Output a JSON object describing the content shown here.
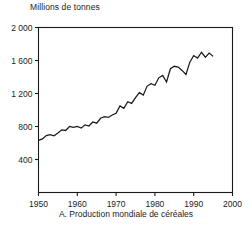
{
  "figure": {
    "yaxis_title": "Millions de tonnes",
    "caption": "A. Production mondiale de céréales"
  },
  "chart_data": {
    "type": "line",
    "title": "A. Production mondiale de céréales",
    "subtitle": "",
    "xlabel": "",
    "ylabel": "Millions de tonnes",
    "xlim": [
      1950,
      2000
    ],
    "ylim": [
      0,
      2000
    ],
    "xticks": [
      1950,
      1960,
      1970,
      1980,
      1990,
      2000
    ],
    "xtick_labels": [
      "1950",
      "1960",
      "1970",
      "1980",
      "1990",
      "2000"
    ],
    "yticks": [
      400,
      800,
      1200,
      1600,
      2000
    ],
    "ytick_labels": [
      "400",
      "800",
      "1 200",
      "1 600",
      "2 000"
    ],
    "grid": false,
    "legend": null,
    "line_color": "#1a1a1a",
    "x": [
      1950,
      1951,
      1952,
      1953,
      1954,
      1955,
      1956,
      1957,
      1958,
      1959,
      1960,
      1961,
      1962,
      1963,
      1964,
      1965,
      1966,
      1967,
      1968,
      1969,
      1970,
      1971,
      1972,
      1973,
      1974,
      1975,
      1976,
      1977,
      1978,
      1979,
      1980,
      1981,
      1982,
      1983,
      1984,
      1985,
      1986,
      1987,
      1988,
      1989,
      1990,
      1991,
      1992,
      1993,
      1994,
      1995
    ],
    "values": [
      632,
      650,
      690,
      700,
      688,
      720,
      760,
      752,
      800,
      790,
      800,
      782,
      820,
      806,
      855,
      840,
      900,
      920,
      910,
      940,
      960,
      1050,
      1020,
      1100,
      1080,
      1150,
      1210,
      1180,
      1290,
      1320,
      1300,
      1390,
      1420,
      1340,
      1500,
      1530,
      1520,
      1480,
      1430,
      1580,
      1660,
      1630,
      1700,
      1640,
      1690,
      1650
    ],
    "series": [
      {
        "name": "Production mondiale de céréales",
        "values": [
          632,
          650,
          690,
          700,
          688,
          720,
          760,
          752,
          800,
          790,
          800,
          782,
          820,
          806,
          855,
          840,
          900,
          920,
          910,
          940,
          960,
          1050,
          1020,
          1100,
          1080,
          1150,
          1210,
          1180,
          1290,
          1320,
          1300,
          1390,
          1420,
          1340,
          1500,
          1530,
          1520,
          1480,
          1430,
          1580,
          1660,
          1630,
          1700,
          1640,
          1690,
          1650
        ]
      }
    ]
  }
}
